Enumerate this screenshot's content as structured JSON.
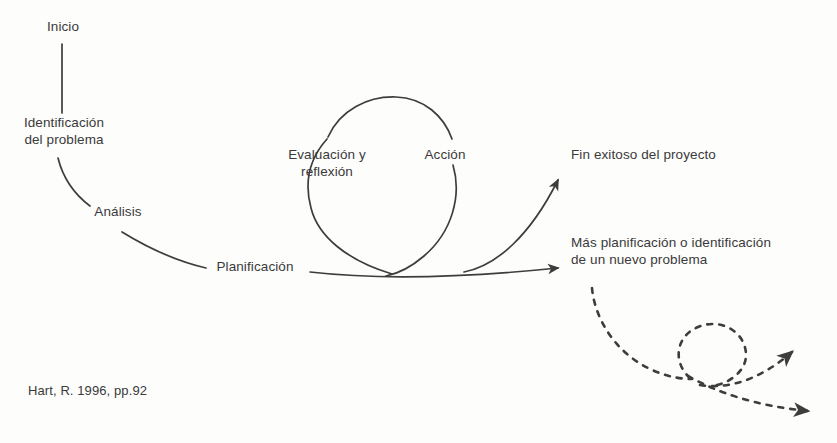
{
  "diagram": {
    "source_citation": "Hart, R. 1996, pp.92",
    "stroke_color": "#3d3d3d",
    "text_color": "#3a3a3a",
    "background_color": "#fdfdfc",
    "nodes": [
      {
        "id": "inicio",
        "label": "Inicio"
      },
      {
        "id": "identificacion",
        "label": "Identificación\ndel problema"
      },
      {
        "id": "analisis",
        "label": "Análisis"
      },
      {
        "id": "planificacion",
        "label": "Planificación"
      },
      {
        "id": "evaluacion",
        "label": "Evaluación y\nreflexión"
      },
      {
        "id": "accion",
        "label": "Acción"
      },
      {
        "id": "fin_exitoso",
        "label": "Fin exitoso del proyecto"
      },
      {
        "id": "mas_planificacion",
        "label": "Más planificación o identificación\nde un nuevo problema"
      }
    ],
    "connectors": [
      {
        "id": "inicio-to-identificacion",
        "style": "solid",
        "arrow": false
      },
      {
        "id": "identificacion-to-analisis",
        "style": "solid",
        "arrow": false
      },
      {
        "id": "analisis-to-planificacion",
        "style": "solid",
        "arrow": false
      },
      {
        "id": "planificacion-baseline",
        "style": "solid",
        "arrow": false
      },
      {
        "id": "action-reflection-loop",
        "style": "solid",
        "arrow": false
      },
      {
        "id": "arrow-to-fin-exitoso",
        "style": "solid",
        "arrow": true
      },
      {
        "id": "arrow-to-mas-planificacion",
        "style": "solid",
        "arrow": true
      },
      {
        "id": "dashed-continuation-loop",
        "style": "dashed",
        "arrow": false
      },
      {
        "id": "dashed-arrow-upper",
        "style": "dashed",
        "arrow": true
      },
      {
        "id": "dashed-arrow-lower",
        "style": "dashed",
        "arrow": true
      }
    ]
  }
}
